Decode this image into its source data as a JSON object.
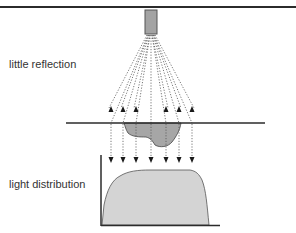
{
  "labels": {
    "top": "little reflection",
    "bottom": "light distribution"
  },
  "colors": {
    "line": "#2b2b2b",
    "emitter_fill": "#a3a3a3",
    "pit_fill": "#a6a6a6",
    "distribution_fill": "#d4d4d4",
    "dotted": "#555555"
  },
  "beams": {
    "count": 7,
    "x_positions": [
      111,
      123,
      136,
      151,
      166,
      179,
      192
    ],
    "reflected_upward": [
      true,
      true,
      true,
      false,
      true,
      true,
      true
    ]
  }
}
